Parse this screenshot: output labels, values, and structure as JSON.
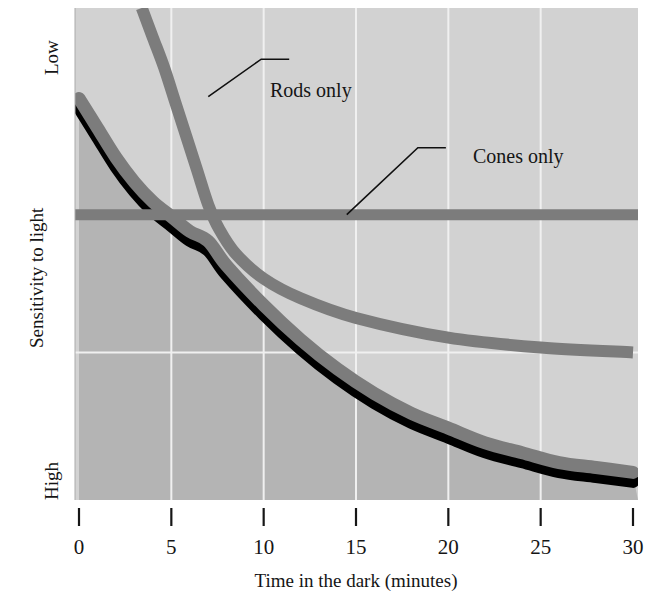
{
  "figure": {
    "background": "#ffffff",
    "plot_bg": "#d2d2d2",
    "plot_bg_shaded": "#b4b4b4",
    "gridline_color": "#f0f0f0",
    "curve_gray": "#7c7c7c",
    "curve_outline": "#000000",
    "axis_color": "#161616"
  },
  "axes": {
    "x": {
      "title": "Time in the dark (minutes)",
      "ticks": [
        {
          "value": 0,
          "label": "0"
        },
        {
          "value": 5,
          "label": "5"
        },
        {
          "value": 10,
          "label": "10"
        },
        {
          "value": 15,
          "label": "15"
        },
        {
          "value": 20,
          "label": "20"
        },
        {
          "value": 25,
          "label": "25"
        },
        {
          "value": 30,
          "label": "30"
        }
      ],
      "min": 0,
      "max": 30
    },
    "y": {
      "title": "Sensitivity to light",
      "top_label": "Low",
      "bottom_label": "High",
      "ticks": [],
      "min": 0,
      "max": 100
    }
  },
  "callouts": [
    {
      "id": "rods",
      "label": "Rods only"
    },
    {
      "id": "cones",
      "label": "Cones only"
    }
  ],
  "chart_data": {
    "type": "line",
    "title": "",
    "xlabel": "Time in the dark (minutes)",
    "ylabel": "Sensitivity to light",
    "xlim": [
      0,
      30
    ],
    "ylim": [
      0,
      100
    ],
    "y_axis_direction": "inverted",
    "y_top_label": "Low",
    "y_bottom_label": "High",
    "grid": {
      "vertical": true,
      "horizontal": true,
      "x_gridlines": [
        5,
        10,
        15,
        20,
        25
      ],
      "y_gridlines": [
        30
      ]
    },
    "legend_position": "inline-callouts",
    "annotations": [
      {
        "text": "Rods only",
        "x": 7.0,
        "y": 82,
        "label_x": 10.3,
        "label_y": 90
      },
      {
        "text": "Cones only",
        "x": 14.5,
        "y": 58,
        "label_x": 19.0,
        "label_y": 72
      }
    ],
    "series": [
      {
        "name": "Rods only",
        "style": "thick gray line, no outline",
        "color": "#7c7c7c",
        "x": [
          3.4,
          4.0,
          4.6,
          5.2,
          5.8,
          6.4,
          7.0,
          7.6,
          8.5,
          10.0,
          12.0,
          15.0,
          20.0,
          25.0,
          30.0
        ],
        "y": [
          100,
          94,
          88,
          81,
          74,
          67,
          60,
          55,
          50,
          45,
          41,
          37,
          33,
          31,
          30
        ]
      },
      {
        "name": "Cones only",
        "style": "thick gray horizontal line",
        "color": "#7c7c7c",
        "x": [
          0,
          30
        ],
        "y": [
          58,
          58
        ]
      },
      {
        "name": "Combined sensitivity",
        "style": "thick gray line with heavy black lower outline; region beneath is shaded darker",
        "color": "#7c7c7c",
        "outline": "#000000",
        "x": [
          0,
          1,
          2,
          3,
          4,
          5,
          6,
          7,
          8,
          10,
          12,
          14,
          16,
          18,
          20,
          22,
          24,
          26,
          28,
          30
        ],
        "y": [
          81,
          75,
          69,
          64,
          60,
          57,
          54,
          52,
          47,
          39,
          32,
          26,
          21,
          17,
          14,
          11,
          9,
          7,
          6,
          5
        ]
      }
    ]
  }
}
